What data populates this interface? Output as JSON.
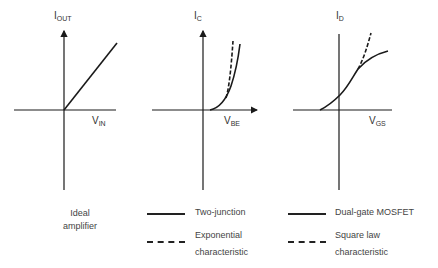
{
  "panels": [
    {
      "y_label": {
        "main": "I",
        "sub": "OUT"
      },
      "x_label": {
        "main": "V",
        "sub": "IN"
      },
      "caption_line1": "Ideal",
      "caption_line2": "amplifier"
    },
    {
      "y_label": {
        "main": "I",
        "sub": "C"
      },
      "x_label": {
        "main": "V",
        "sub": "BE"
      },
      "legend": [
        {
          "style": "solid",
          "line1": "Two-junction",
          "line2": ""
        },
        {
          "style": "dashed",
          "line1": "Exponential",
          "line2": "characteristic"
        }
      ]
    },
    {
      "y_label": {
        "main": "I",
        "sub": "D"
      },
      "x_label": {
        "main": "V",
        "sub": "GS"
      },
      "legend": [
        {
          "style": "solid",
          "line1": "Dual-gate MOSFET",
          "line2": ""
        },
        {
          "style": "dashed",
          "line1": "Square law",
          "line2": "characteristic"
        }
      ]
    }
  ],
  "colors": {
    "line": "#1a1a1a",
    "text": "#444444",
    "background": "#ffffff"
  }
}
